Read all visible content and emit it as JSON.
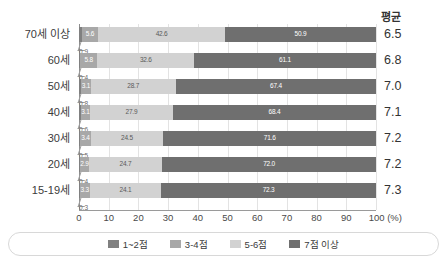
{
  "header": {
    "mean_label": "평균"
  },
  "axis": {
    "ticks": [
      "0",
      "10",
      "20",
      "30",
      "40",
      "50",
      "60",
      "70",
      "80",
      "90",
      "100 (%)"
    ],
    "tick_values": [
      0,
      10,
      20,
      30,
      40,
      50,
      60,
      70,
      80,
      90,
      100
    ],
    "unit": "(%)"
  },
  "legend": {
    "items": [
      {
        "label": "1~2점",
        "color": "#808080"
      },
      {
        "label": "3-4점",
        "color": "#a8a8a8"
      },
      {
        "label": "5-6점",
        "color": "#d2d2d2"
      },
      {
        "label": "7점 이상",
        "color": "#6f6f6f"
      }
    ]
  },
  "rows": [
    {
      "category": "70세 이상",
      "v1": "0.9",
      "v2": "5.6",
      "v3": "42.6",
      "v4": "50.9",
      "mean": "6.5"
    },
    {
      "category": "60세",
      "v1": "0.4",
      "v2": "5.8",
      "v3": "32.6",
      "v4": "61.1",
      "mean": "6.8"
    },
    {
      "category": "50세",
      "v1": "0.8",
      "v2": "3.1",
      "v3": "28.7",
      "v4": "67.4",
      "mean": "7.0"
    },
    {
      "category": "40세",
      "v1": "0.6",
      "v2": "3.1",
      "v3": "27.9",
      "v4": "68.4",
      "mean": "7.1"
    },
    {
      "category": "30세",
      "v1": "0.5",
      "v2": "3.4",
      "v3": "24.5",
      "v4": "71.6",
      "mean": "7.2"
    },
    {
      "category": "20세",
      "v1": "0.4",
      "v2": "2.9",
      "v3": "24.7",
      "v4": "72.0",
      "mean": "7.2"
    },
    {
      "category": "15-19세",
      "v1": "0.3",
      "v2": "3.3",
      "v3": "24.1",
      "v4": "72.3",
      "mean": "7.3"
    }
  ],
  "chart_data": {
    "type": "bar",
    "orientation": "horizontal",
    "stacked": true,
    "stack_mode": "percent",
    "title": "",
    "xlabel": "(%)",
    "ylabel": "",
    "xlim": [
      0,
      100
    ],
    "grid": true,
    "legend_position": "bottom",
    "categories": [
      "70세 이상",
      "60세",
      "50세",
      "40세",
      "30세",
      "20세",
      "15-19세"
    ],
    "series": [
      {
        "name": "1~2점",
        "color": "#808080",
        "values": [
          0.9,
          0.4,
          0.8,
          0.6,
          0.5,
          0.4,
          0.3
        ]
      },
      {
        "name": "3-4점",
        "color": "#a8a8a8",
        "values": [
          5.6,
          5.8,
          3.1,
          3.1,
          3.4,
          2.9,
          3.3
        ]
      },
      {
        "name": "5-6점",
        "color": "#d2d2d2",
        "values": [
          42.6,
          32.6,
          28.7,
          27.9,
          24.5,
          24.7,
          24.1
        ]
      },
      {
        "name": "7점 이상",
        "color": "#6f6f6f",
        "values": [
          50.9,
          61.1,
          67.4,
          68.4,
          71.6,
          72.0,
          72.3
        ]
      }
    ],
    "annotations": {
      "mean_column_label": "평균",
      "mean_values": [
        6.5,
        6.8,
        7.0,
        7.1,
        7.2,
        7.2,
        7.3
      ]
    },
    "xticks": [
      0,
      10,
      20,
      30,
      40,
      50,
      60,
      70,
      80,
      90,
      100
    ]
  }
}
